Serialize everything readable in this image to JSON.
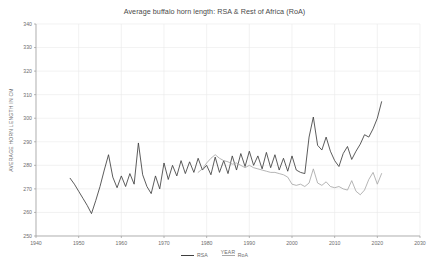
{
  "chart_data": {
    "type": "line",
    "title": "Average buffalo horn length: RSA & Rest of Africa (RoA)",
    "xlabel": "YEAR",
    "ylabel": "AVERAGE HORN LENGTH IN CM",
    "xlim": [
      1940,
      2030
    ],
    "ylim": [
      250,
      340
    ],
    "xticks": [
      1940,
      1950,
      1960,
      1970,
      1980,
      1990,
      2000,
      2010,
      2020,
      2030
    ],
    "yticks": [
      250,
      260,
      270,
      280,
      290,
      300,
      310,
      320,
      330,
      340
    ],
    "grid": true,
    "legend_position": "bottom-center",
    "colors": {
      "RSA": "#3f3f3f",
      "RoA": "#a8a8a8"
    },
    "series": [
      {
        "name": "RSA",
        "color": "#3f3f3f",
        "x": [
          1948,
          1949,
          1950,
          1951,
          1952,
          1953,
          1954,
          1955,
          1956,
          1957,
          1958,
          1959,
          1960,
          1961,
          1962,
          1963,
          1964,
          1965,
          1966,
          1967,
          1968,
          1969,
          1970,
          1971,
          1972,
          1973,
          1974,
          1975,
          1976,
          1977,
          1978,
          1979,
          1980,
          1981,
          1982,
          1983,
          1984,
          1985,
          1986,
          1987,
          1988,
          1989,
          1990,
          1991,
          1992,
          1993,
          1994,
          1995,
          1996,
          1997,
          1998,
          1999,
          2000,
          2001,
          2002,
          2003,
          2004,
          2005,
          2006,
          2007,
          2008,
          2009,
          2010,
          2011,
          2012,
          2013,
          2014,
          2015,
          2016,
          2017,
          2018,
          2019,
          2020,
          2021
        ],
        "values": [
          274.5,
          272.0,
          269.0,
          266.0,
          263.0,
          259.5,
          265.0,
          271.0,
          278.0,
          284.5,
          275.0,
          270.5,
          275.5,
          271.0,
          276.5,
          272.0,
          289.5,
          276.0,
          271.0,
          268.0,
          275.5,
          270.0,
          281.0,
          274.0,
          280.0,
          275.5,
          282.0,
          276.5,
          281.5,
          277.0,
          283.0,
          278.0,
          280.0,
          276.0,
          283.5,
          277.0,
          282.0,
          276.5,
          284.0,
          278.0,
          285.0,
          279.5,
          286.0,
          280.0,
          284.0,
          278.5,
          285.5,
          279.0,
          284.5,
          278.0,
          283.0,
          277.5,
          284.0,
          278.0,
          277.0,
          276.5,
          292.0,
          300.5,
          288.5,
          286.5,
          292.0,
          286.0,
          282.0,
          279.5,
          285.0,
          288.0,
          282.5,
          286.0,
          289.0,
          293.0,
          292.0,
          295.5,
          300.0,
          307.0
        ]
      },
      {
        "name": "RoA",
        "color": "#a8a8a8",
        "x": [
          1978,
          1979,
          1980,
          1981,
          1982,
          1983,
          1984,
          1985,
          1986,
          1987,
          1988,
          1989,
          1990,
          1991,
          1992,
          1993,
          1994,
          1995,
          1996,
          1997,
          1998,
          1999,
          2000,
          2001,
          2002,
          2003,
          2004,
          2005,
          2006,
          2007,
          2008,
          2009,
          2010,
          2011,
          2012,
          2013,
          2014,
          2015,
          2016,
          2017,
          2018,
          2019,
          2020,
          2021
        ],
        "values": [
          277.0,
          278.5,
          281.0,
          283.0,
          284.5,
          283.0,
          282.0,
          281.5,
          280.5,
          281.0,
          280.0,
          279.0,
          280.0,
          279.0,
          278.5,
          278.0,
          277.5,
          277.0,
          277.0,
          276.5,
          276.0,
          275.0,
          272.0,
          271.5,
          272.0,
          271.0,
          272.5,
          278.5,
          272.5,
          271.5,
          273.0,
          271.0,
          270.5,
          271.0,
          270.0,
          269.5,
          273.5,
          269.0,
          267.5,
          269.5,
          274.0,
          277.0,
          272.0,
          276.5
        ]
      }
    ]
  }
}
